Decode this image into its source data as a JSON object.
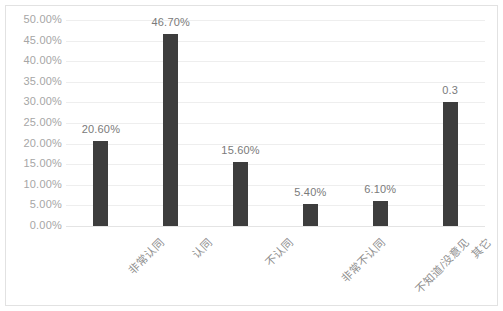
{
  "chart_data": {
    "type": "bar",
    "title": "",
    "xlabel": "",
    "ylabel": "",
    "categories": [
      "非常认同",
      "认同",
      "不认同",
      "非常不认同",
      "不知道/没意见",
      "其它"
    ],
    "values": [
      20.6,
      46.7,
      15.6,
      5.4,
      6.1,
      30.0
    ],
    "value_labels": [
      "20.60%",
      "46.70%",
      "15.60%",
      "5.40%",
      "6.10%",
      "0.3"
    ],
    "ylim": [
      0,
      50
    ],
    "ytick_values": [
      0,
      5,
      10,
      15,
      20,
      25,
      30,
      35,
      40,
      45,
      50
    ],
    "ytick_labels": [
      "0.00%",
      "5.00%",
      "10.00%",
      "15.00%",
      "20.00%",
      "25.00%",
      "30.00%",
      "35.00%",
      "40.00%",
      "45.00%",
      "50.00%"
    ],
    "grid": true,
    "legend": false,
    "legend_position": "none",
    "series": [
      {
        "name": "",
        "values": [
          20.6,
          46.7,
          15.6,
          5.4,
          6.1,
          30.0
        ]
      }
    ],
    "colors": {
      "bar": "#3d3d3d",
      "gridline": "#eeeeee",
      "tick_text": "#a6a6a6",
      "category_text": "#8f8f8f",
      "value_text": "#7a7a7a",
      "border": "#e2e2e2",
      "background": "#ffffff"
    }
  }
}
